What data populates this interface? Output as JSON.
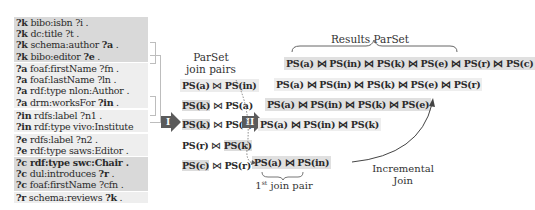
{
  "triple_patterns": {
    "groups": [
      {
        "shade": "dark",
        "lines": [
          {
            "var": "?k",
            "rest": " bibo:isbn ?i ."
          },
          {
            "var": "?k",
            "rest": " dc:title ?t ."
          },
          {
            "var": "?k",
            "rest": " schema:author ",
            "bold_obj": "?a",
            "end": " ."
          },
          {
            "var": "?k",
            "rest": " bibo:editor ",
            "bold_obj": "?e",
            "end": " ."
          }
        ]
      },
      {
        "shade": "light",
        "lines": [
          {
            "var": "?a",
            "rest": " foaf:firstName ?fn ."
          },
          {
            "var": "?a",
            "rest": " foaf:lastName ?ln ."
          },
          {
            "var": "?a",
            "rest": " rdf:type nlon:Author ."
          },
          {
            "var": "?a",
            "rest": " drm:worksFor ",
            "bold_obj": "?in",
            "end": " ."
          }
        ]
      },
      {
        "shade": "light",
        "lines": [
          {
            "var": "?in",
            "rest": " rdfs:label ?n1 ."
          },
          {
            "var": "?in",
            "rest": " rdf:type vivo:Institute"
          }
        ]
      },
      {
        "shade": "light",
        "lines": [
          {
            "var": "?e",
            "rest": " rdfs:label ?n2 ."
          },
          {
            "var": "?e",
            "rest": " rdf:type saws:Editor ."
          }
        ]
      },
      {
        "shade": "dark",
        "lines": [
          {
            "var": "?c",
            "rest": " rdf:type swc:Chair .",
            "bold_all": true
          },
          {
            "var": "?c",
            "rest": " dul:introduces ",
            "bold_obj": "?r",
            "end": " ."
          },
          {
            "var": "?c",
            "rest": " foaf:firstName ?cfn ."
          }
        ]
      },
      {
        "shade": "light",
        "lines": [
          {
            "var": "?r",
            "rest": " schema:reviews ",
            "bold_obj": "?k",
            "end": " ."
          }
        ]
      }
    ]
  },
  "steps": {
    "step1": "I",
    "step2": "II"
  },
  "parset": {
    "title_line1": "ParSet",
    "title_line2": "join pairs",
    "pairs": [
      {
        "left": "PS(a)",
        "op": " ⋈ ",
        "right": "PS(in)",
        "hl": "none"
      },
      {
        "left": "PS(k)",
        "op": " ⋈ ",
        "right": "PS(a)",
        "hl": "left"
      },
      {
        "left": "PS(k)",
        "op": " ⋈ ",
        "right": "PS(e)",
        "hl": "left"
      },
      {
        "left": "PS(r)",
        "op": " ⋈ ",
        "right": "PS(k)",
        "hl": "right"
      },
      {
        "left": "PS(c)",
        "op": " ⋈ ",
        "right": "PS(r)",
        "hl": "left"
      }
    ]
  },
  "results": {
    "title": "Results ParSet",
    "rows": [
      "PS(a) ⋈ PS(in) ⋈ PS(k) ⋈ PS(e) ⋈ PS(r) ⋈ PS(c)",
      "PS(a) ⋈ PS(in) ⋈ PS(k) ⋈ PS(e) ⋈ PS(r)",
      "PS(a) ⋈ PS(in) ⋈ PS(k) ⋈ PS(e)",
      "PS(a) ⋈ PS(in) ⋈ PS(k)",
      "PS(a) ⋈ PS(in)"
    ],
    "first_pair_label": "1st join pair",
    "first_pair_sup": "st",
    "first_pair_num": "1",
    "first_pair_text": " join pair",
    "incremental_line1": "Incremental",
    "incremental_line2": "Join"
  }
}
